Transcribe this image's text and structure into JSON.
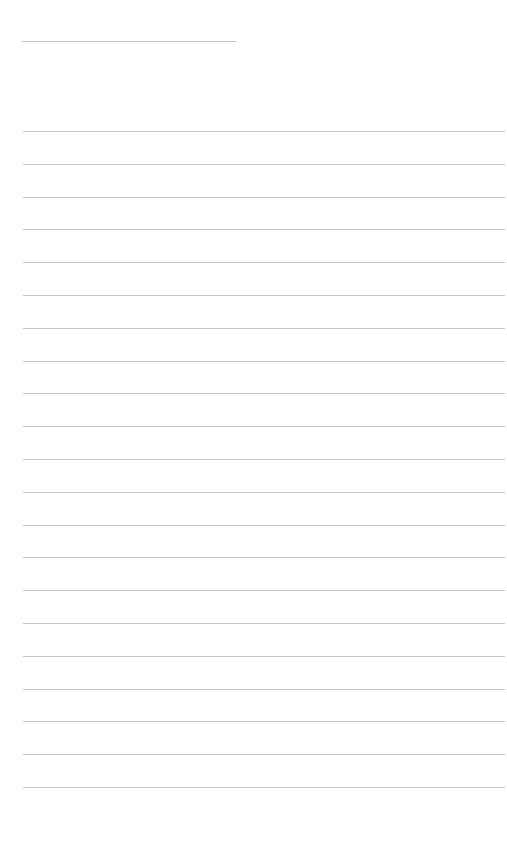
{
  "page": {
    "type": "lined-paper",
    "title_line": {
      "x": 22,
      "y": 41,
      "width": 214
    },
    "ruled_lines": {
      "count": 21,
      "start_y": 131,
      "spacing": 32.8,
      "x": 23,
      "width": 482
    },
    "line_color": "#c4c4c4",
    "background": "#ffffff"
  }
}
